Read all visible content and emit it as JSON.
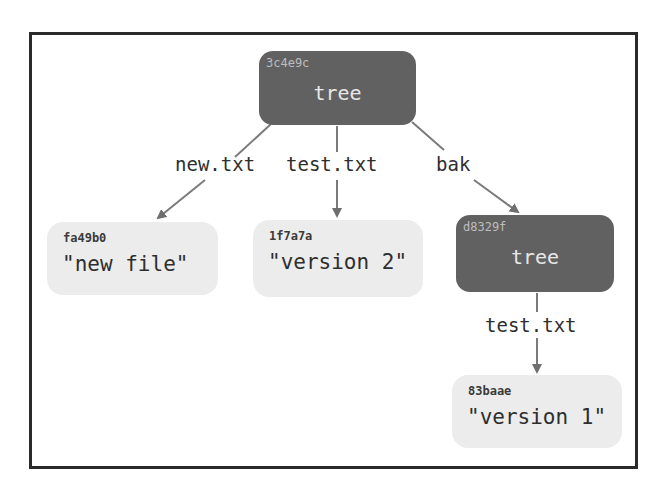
{
  "diagram": {
    "title": "",
    "colors": {
      "tree_fill": "#616161",
      "blob_fill": "#ececec",
      "edge": "#6f6f6f",
      "frame": "#2a2a2a"
    },
    "nodes": {
      "root_tree": {
        "hash": "3c4e9c",
        "type": "tree",
        "label": "tree"
      },
      "blob_new": {
        "hash": "fa49b0",
        "type": "blob",
        "label": "\"new file\""
      },
      "blob_v2": {
        "hash": "1f7a7a",
        "type": "blob",
        "label": "\"version 2\""
      },
      "bak_tree": {
        "hash": "d8329f",
        "type": "tree",
        "label": "tree"
      },
      "blob_v1": {
        "hash": "83baae",
        "type": "blob",
        "label": "\"version 1\""
      }
    },
    "edges": [
      {
        "from": "3c4e9c",
        "to": "fa49b0",
        "label": "new.txt"
      },
      {
        "from": "3c4e9c",
        "to": "1f7a7a",
        "label": "test.txt"
      },
      {
        "from": "3c4e9c",
        "to": "d8329f",
        "label": "bak"
      },
      {
        "from": "d8329f",
        "to": "83baae",
        "label": "test.txt"
      }
    ]
  }
}
